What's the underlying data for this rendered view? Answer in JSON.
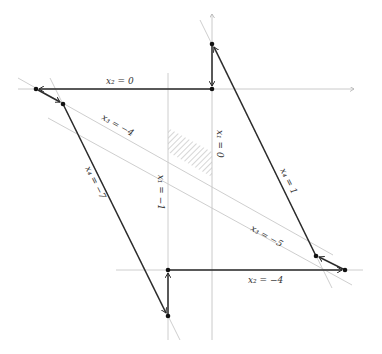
{
  "diagram": {
    "type": "linear-program-simplex-path",
    "labels": {
      "x2_eq_0": "x₂ = 0",
      "x2_eq_m4": "x₂ = −4",
      "x1_eq_0": "x₁ = 0",
      "x1_eq_m1": "x₁ = −1",
      "x3_eq_m4": "x₃ = −4",
      "x3_eq_m5": "x₃ = −5",
      "x4_eq_1": "x₄ = 1",
      "x4_eq_m7": "x₄ = −7"
    },
    "vertices": [
      {
        "id": "v1",
        "x": 212,
        "y": 44
      },
      {
        "id": "v2",
        "x": 212,
        "y": 89
      },
      {
        "id": "v3",
        "x": 36,
        "y": 89
      },
      {
        "id": "v4",
        "x": 63,
        "y": 104
      },
      {
        "id": "v5",
        "x": 168,
        "y": 316
      },
      {
        "id": "v6",
        "x": 168,
        "y": 270
      },
      {
        "id": "v7",
        "x": 345,
        "y": 270
      },
      {
        "id": "v8",
        "x": 316,
        "y": 256
      }
    ],
    "feasible_region": "hatched parallelogram between x1=-1, x1=0, x3=-4, x3=-5",
    "colors": {
      "constraint_line": "#c8c8c8",
      "path": "#2a2a2a",
      "vertex": "#111111",
      "hatch": "#888888"
    }
  }
}
